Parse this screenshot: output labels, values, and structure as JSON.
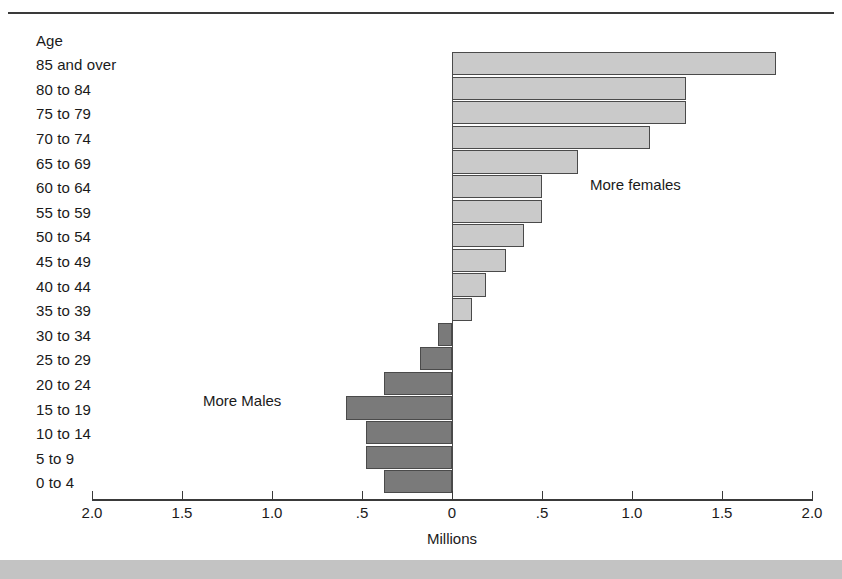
{
  "figure": {
    "background_color": "#ffffff",
    "bottom_band_color": "#c3c3c3",
    "rule_color": "#3a3a3a"
  },
  "chart_data": {
    "type": "bar",
    "orientation": "horizontal",
    "title": "",
    "subtitle": "",
    "xlabel": "Millions",
    "ylabel": "Age",
    "categories": [
      "85 and over",
      "80 to 84",
      "75 to 79",
      "70 to 74",
      "65 to 69",
      "60 to 64",
      "55 to 59",
      "50 to 54",
      "45 to 49",
      "40 to 44",
      "35 to 39",
      "30 to 34",
      "25 to 29",
      "20 to 24",
      "15 to 19",
      "10 to 14",
      "5 to 9",
      "0 to 4"
    ],
    "values": [
      1.8,
      1.3,
      1.3,
      1.1,
      0.7,
      0.5,
      0.5,
      0.4,
      0.3,
      0.19,
      0.11,
      -0.08,
      -0.18,
      -0.38,
      -0.59,
      -0.48,
      -0.48,
      -0.38
    ],
    "value_sign_meaning": {
      "positive": "More females",
      "negative": "More Males"
    },
    "xlim": [
      -2.0,
      2.0
    ],
    "xticks": [
      -2.0,
      -1.5,
      -1.0,
      -0.5,
      0,
      0.5,
      1.0,
      1.5,
      2.0
    ],
    "xtick_labels": [
      "2.0",
      "1.5",
      "1.0",
      ".5",
      "0",
      ".5",
      "1.0",
      "1.5",
      "2.0"
    ],
    "grid": false,
    "legend": false,
    "legend_position": "none",
    "annotations": [
      {
        "text": "More females",
        "x": 0.77,
        "y": "60 to 64"
      },
      {
        "text": "More Males",
        "x": -1.38,
        "y": "15 to 19"
      }
    ],
    "series": [
      {
        "name": "More females",
        "color": "#cacaca",
        "border_color": "#4a4a4a"
      },
      {
        "name": "More Males",
        "color": "#7a7a7a",
        "border_color": "#4a4a4a"
      }
    ]
  }
}
